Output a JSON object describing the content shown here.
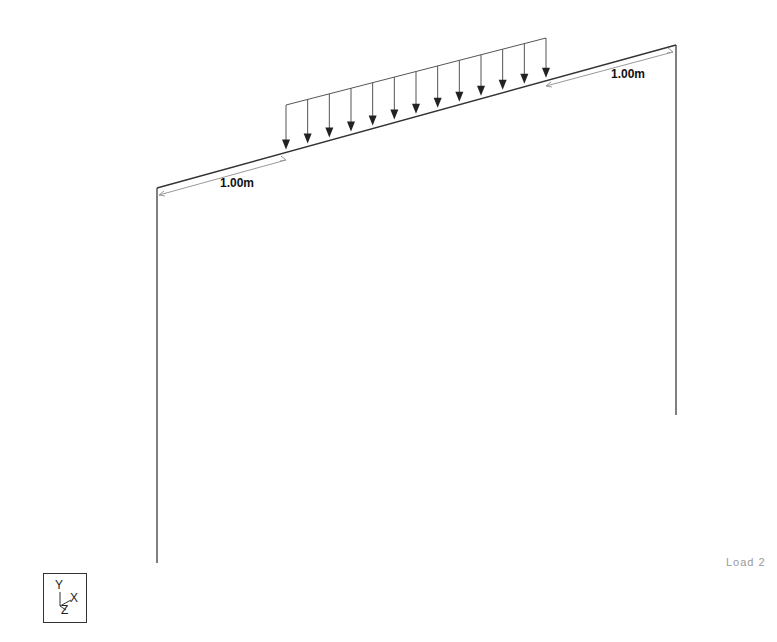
{
  "viewport": {
    "background": "#ffffff",
    "load_case_label": "Load 2"
  },
  "dimensions": [
    {
      "id": "left",
      "label": "1.00m"
    },
    {
      "id": "right",
      "label": "1.00m"
    }
  ],
  "load": {
    "type": "uniformly distributed load",
    "direction": "-Y",
    "arrow_count": 13
  },
  "axis_triad": {
    "labels": {
      "y": "Y",
      "x": "X",
      "z": "Z"
    }
  },
  "colors": {
    "structure": "#444444",
    "arrows": "#222222",
    "dimension": "#777777",
    "label": "#111111",
    "load_case": "#999999"
  }
}
